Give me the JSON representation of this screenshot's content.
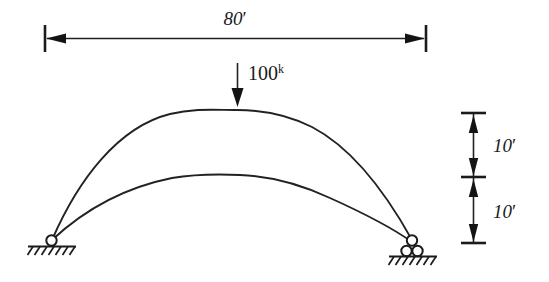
{
  "figure": {
    "background_color": "#ffffff",
    "line_color": "#222222",
    "text_color": "#1a1a1a"
  },
  "dimensions": {
    "span": {
      "value": "80",
      "unit_mark": "′",
      "label": "80′",
      "orientation": "horizontal",
      "position": "top"
    },
    "rise_upper": {
      "value": "10",
      "unit_mark": "′",
      "label": "10′",
      "orientation": "vertical",
      "position": "right-upper"
    },
    "rise_lower": {
      "value": "10",
      "unit_mark": "′",
      "label": "10′",
      "orientation": "vertical",
      "position": "right-lower"
    }
  },
  "load": {
    "magnitude": "100",
    "unit_superscript": "k",
    "label": "100k",
    "direction": "downward",
    "applied_at": "crown of upper arch"
  },
  "supports": {
    "left": {
      "type": "pin",
      "label": "pin-support"
    },
    "right": {
      "type": "roller",
      "label": "roller-support"
    }
  },
  "members": {
    "upper_arch": "upper-arch-curve",
    "lower_arch": "lower-arch-curve"
  }
}
